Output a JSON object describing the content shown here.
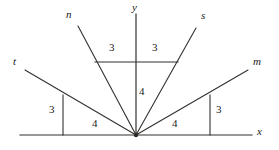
{
  "figure": {
    "stroke_color": "#33312f",
    "background_color": "#ffffff",
    "origin": {
      "x": 136,
      "y": 135
    },
    "axes": [
      {
        "name": "x-axis",
        "label": "x",
        "label_x": 258,
        "label_y": 130,
        "x1": 20,
        "y1": 135,
        "x2": 252,
        "y2": 135
      },
      {
        "name": "y-axis",
        "label": "y",
        "label_x": 133,
        "label_y": 4,
        "x1": 136,
        "y1": 14,
        "x2": 136,
        "y2": 135
      }
    ],
    "rays": [
      {
        "name": "ray-t",
        "label": "t",
        "label_x": 13,
        "label_y": 60,
        "x1": 136,
        "y1": 135,
        "x2": 25,
        "y2": 70
      },
      {
        "name": "ray-n",
        "label": "n",
        "label_x": 66,
        "label_y": 12,
        "x1": 136,
        "y1": 135,
        "x2": 78,
        "y2": 26
      },
      {
        "name": "ray-s",
        "label": "s",
        "label_x": 201,
        "label_y": 13,
        "x1": 136,
        "y1": 135,
        "x2": 196,
        "y2": 28
      },
      {
        "name": "ray-m",
        "label": "m",
        "label_x": 253,
        "label_y": 60,
        "x1": 136,
        "y1": 135,
        "x2": 248,
        "y2": 70
      }
    ],
    "triangles": [
      {
        "name": "triangle-t",
        "vertical_leg": {
          "x1": 63,
          "y1": 95,
          "x2": 63,
          "y2": 135
        },
        "leg_labels": [
          {
            "name": "leg-label-t-rise",
            "text": "3",
            "x": 50,
            "y": 108
          },
          {
            "name": "leg-label-t-run",
            "text": "4",
            "x": 93,
            "y": 122
          }
        ]
      },
      {
        "name": "triangle-n",
        "vertical_leg": null,
        "leg_labels": [
          {
            "name": "leg-label-n-run",
            "text": "3",
            "x": 110,
            "y": 45
          }
        ]
      },
      {
        "name": "triangle-ns-shared",
        "horizontal_leg": {
          "x1": 95,
          "y1": 62,
          "x2": 178,
          "y2": 62
        },
        "leg_labels": [
          {
            "name": "leg-label-y-rise",
            "text": "4",
            "x": 140,
            "y": 91
          }
        ]
      },
      {
        "name": "triangle-s",
        "vertical_leg": null,
        "leg_labels": [
          {
            "name": "leg-label-s-run",
            "text": "3",
            "x": 152,
            "y": 45
          }
        ]
      },
      {
        "name": "triangle-m",
        "vertical_leg": {
          "x1": 210,
          "y1": 95,
          "x2": 210,
          "y2": 135
        },
        "leg_labels": [
          {
            "name": "leg-label-m-rise",
            "text": "3",
            "x": 216,
            "y": 108
          },
          {
            "name": "leg-label-m-run",
            "text": "4",
            "x": 172,
            "y": 122
          }
        ]
      }
    ],
    "length_labels": [
      {
        "name": "length-label-1",
        "text": "3",
        "x": 110,
        "y": 45
      },
      {
        "name": "length-label-2",
        "text": "3",
        "x": 152,
        "y": 45
      },
      {
        "name": "length-label-3",
        "text": "4",
        "x": 140,
        "y": 91
      },
      {
        "name": "length-label-4",
        "text": "3",
        "x": 50,
        "y": 108
      },
      {
        "name": "length-label-5",
        "text": "4",
        "x": 93,
        "y": 122
      },
      {
        "name": "length-label-6",
        "text": "4",
        "x": 172,
        "y": 122
      },
      {
        "name": "length-label-7",
        "text": "3",
        "x": 216,
        "y": 108
      }
    ]
  }
}
